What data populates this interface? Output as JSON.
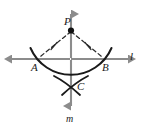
{
  "figure": {
    "type": "geometry-construction"
  },
  "labels": {
    "point_p": "P",
    "point_a": "A",
    "point_b": "B",
    "point_c": "C",
    "line_l": "l",
    "line_m": "m"
  },
  "colors": {
    "line_gray": "#8c8c8c",
    "ink_black": "#1a1a1a",
    "background": "#ffffff"
  },
  "geometry": {
    "point_p": [
      71,
      30
    ],
    "point_a": [
      37,
      59
    ],
    "point_b": [
      105,
      59
    ],
    "point_c": [
      71,
      86
    ],
    "line_l_from": [
      4,
      59
    ],
    "line_l_to": [
      137,
      59
    ],
    "line_m_from": [
      71,
      6
    ],
    "line_m_to": [
      71,
      112
    ],
    "arc_radius": 44,
    "tick_marks": 2
  }
}
